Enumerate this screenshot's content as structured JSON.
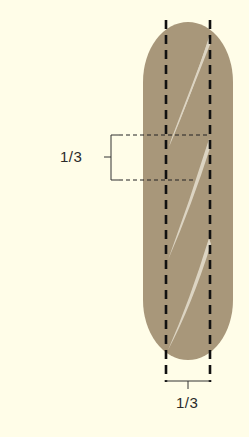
{
  "diagram": {
    "colors": {
      "background": "#FFFDE8",
      "loaf": "#A8977A",
      "score": "#DCD4C2",
      "line": "#111111",
      "bracket": "#333333"
    },
    "labels": {
      "side_fraction": "1/3",
      "bottom_fraction": "1/3"
    },
    "scores_count": 3,
    "guides": {
      "vertical_dashed_lines": 2,
      "horizontal_dashed_lines": 2
    }
  }
}
